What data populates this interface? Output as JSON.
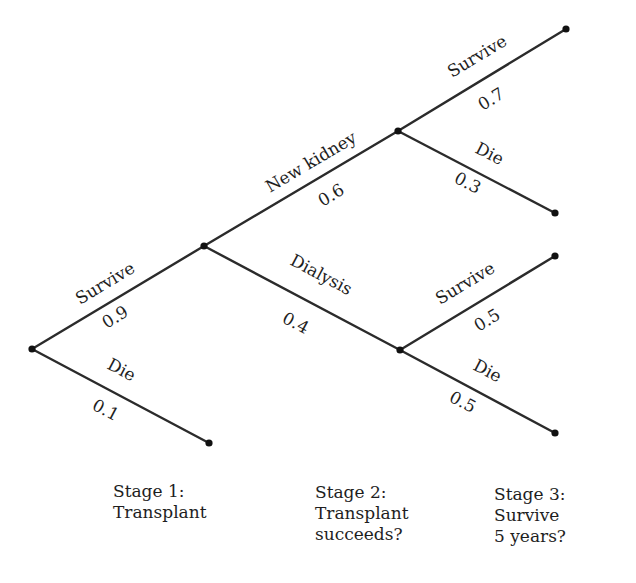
{
  "diagram": {
    "type": "probability-tree",
    "nodes": {
      "root": {
        "x": 32,
        "y": 349
      },
      "s1_survive": {
        "x": 204,
        "y": 246
      },
      "s1_die": {
        "x": 209,
        "y": 443
      },
      "s2_new_kidney": {
        "x": 398,
        "y": 131
      },
      "s2_dialysis": {
        "x": 400,
        "y": 350
      },
      "s3_nk_survive": {
        "x": 566,
        "y": 29
      },
      "s3_nk_die": {
        "x": 555,
        "y": 213
      },
      "s3_dia_survive": {
        "x": 555,
        "y": 256
      },
      "s3_dia_die": {
        "x": 555,
        "y": 433
      }
    },
    "branches": [
      {
        "id": "stage1-survive",
        "from": "root",
        "to": "s1_survive",
        "label": "Survive",
        "prob": "0.9"
      },
      {
        "id": "stage1-die",
        "from": "root",
        "to": "s1_die",
        "label": "Die",
        "prob": "0.1"
      },
      {
        "id": "stage2-new-kidney",
        "from": "s1_survive",
        "to": "s2_new_kidney",
        "label": "New kidney",
        "prob": "0.6"
      },
      {
        "id": "stage2-dialysis",
        "from": "s1_survive",
        "to": "s2_dialysis",
        "label": "Dialysis",
        "prob": "0.4"
      },
      {
        "id": "stage3-nk-survive",
        "from": "s2_new_kidney",
        "to": "s3_nk_survive",
        "label": "Survive",
        "prob": "0.7"
      },
      {
        "id": "stage3-nk-die",
        "from": "s2_new_kidney",
        "to": "s3_nk_die",
        "label": "Die",
        "prob": "0.3"
      },
      {
        "id": "stage3-dia-survive",
        "from": "s2_dialysis",
        "to": "s3_dia_survive",
        "label": "Survive",
        "prob": "0.5"
      },
      {
        "id": "stage3-dia-die",
        "from": "s2_dialysis",
        "to": "s3_dia_die",
        "label": "Die",
        "prob": "0.5"
      }
    ],
    "stages": [
      {
        "lines": [
          "Stage 1:",
          "Transplant"
        ]
      },
      {
        "lines": [
          "Stage 2:",
          "Transplant",
          "succeeds?"
        ]
      },
      {
        "lines": [
          "Stage 3:",
          "Survive",
          "5 years?"
        ]
      }
    ],
    "colors": {
      "line": "#2b2b2b",
      "node": "#111111",
      "text": "#1e1e1e",
      "background": "#ffffff"
    }
  }
}
